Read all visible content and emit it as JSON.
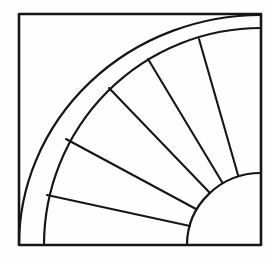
{
  "canvas": {
    "width": 273,
    "height": 261,
    "paper_color": "#fefefe",
    "ink_color": "#161616"
  },
  "drawing": {
    "description": "Black-and-white line drawing of a quarter-circle fan quilt block: a square containing an outer curved band and five spokes radiating from a small quarter-circle hub in the bottom-right corner",
    "fan_center": {
      "x": 261,
      "y": 245
    },
    "square": {
      "x": 19,
      "y": 14,
      "width": 242,
      "height": 231,
      "stroke_width": 2.6
    },
    "outer_arc": {
      "rx": 242,
      "ry": 230,
      "from": {
        "x": 261,
        "y": 15
      },
      "to": {
        "x": 19,
        "y": 245
      },
      "stroke_width": 2.2
    },
    "inner_arc": {
      "rx": 217,
      "ry": 217,
      "from": {
        "x": 261,
        "y": 28
      },
      "to": {
        "x": 44,
        "y": 245
      },
      "stroke_width": 2.2
    },
    "hub_arc": {
      "rx": 74,
      "ry": 72,
      "from": {
        "x": 261,
        "y": 173
      },
      "to": {
        "x": 187,
        "y": 245
      },
      "stroke_width": 2.2
    },
    "spokes": [
      {
        "x1": 199,
        "y1": 39,
        "x2": 238,
        "y2": 175
      },
      {
        "x1": 148,
        "y1": 59,
        "x2": 222,
        "y2": 182
      },
      {
        "x1": 109,
        "y1": 88,
        "x2": 209,
        "y2": 192
      },
      {
        "x1": 66,
        "y1": 139,
        "x2": 196,
        "y2": 209
      },
      {
        "x1": 47,
        "y1": 195,
        "x2": 190,
        "y2": 226
      }
    ],
    "spoke_stroke_width": 2.1
  }
}
